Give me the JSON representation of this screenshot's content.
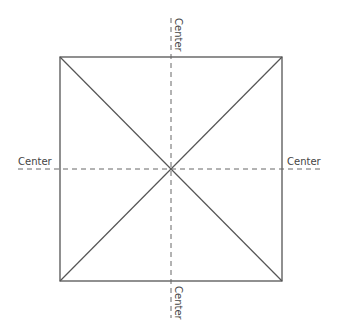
{
  "diagram": {
    "square": {
      "x": 60,
      "y": 57,
      "width": 222,
      "height": 224,
      "stroke": "#555555"
    },
    "center": {
      "x": 171,
      "y": 169
    },
    "diagonal_color": "#555555",
    "centerline_color": "#666666",
    "labels": {
      "top": "Center",
      "bottom": "Center",
      "left": "Center",
      "right": "Center"
    }
  }
}
